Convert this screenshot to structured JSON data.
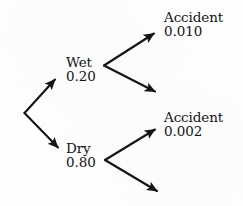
{
  "diagram": {
    "type": "probability-tree",
    "stroke_color": "#141414",
    "background_color": "#fefefe",
    "nodes": [
      {
        "id": "wet",
        "name": "Wet",
        "probability": "0.20"
      },
      {
        "id": "dry",
        "name": "Dry",
        "probability": "0.80"
      },
      {
        "id": "accident-wet",
        "name": "Accident",
        "probability": "0.010"
      },
      {
        "id": "accident-dry",
        "name": "Accident",
        "probability": "0.002"
      }
    ],
    "branches": [
      {
        "id": "root-to-wet",
        "from": "root",
        "to": "wet",
        "labeled": true
      },
      {
        "id": "root-to-dry",
        "from": "root",
        "to": "dry",
        "labeled": true
      },
      {
        "id": "wet-to-accident",
        "from": "wet",
        "to": "accident-wet",
        "labeled": true
      },
      {
        "id": "wet-to-no-accident",
        "from": "wet",
        "to": "",
        "labeled": false
      },
      {
        "id": "dry-to-accident",
        "from": "dry",
        "to": "accident-dry",
        "labeled": true
      },
      {
        "id": "dry-to-no-accident",
        "from": "dry",
        "to": "",
        "labeled": false
      }
    ]
  }
}
